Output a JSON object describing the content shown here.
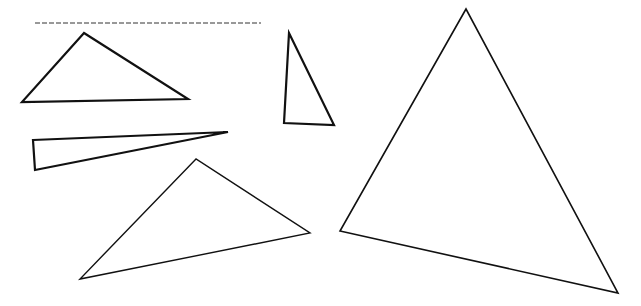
{
  "canvas": {
    "width": 641,
    "height": 306,
    "background": "#ffffff",
    "stroke": "#111111"
  },
  "name_line": {
    "x1": 35,
    "y1": 23,
    "x2": 261,
    "y2": 23,
    "dashed": true
  },
  "triangles": [
    {
      "id": "triangle-1",
      "points": "84,33 22,102 188,99",
      "stroke_width": 2.2
    },
    {
      "id": "triangle-2",
      "points": "289,33 284,123 334,125",
      "stroke_width": 2.2
    },
    {
      "id": "triangle-3",
      "points": "33,140 228,132 35,170",
      "stroke_width": 2.2
    },
    {
      "id": "triangle-4",
      "points": "196,159 80,279 310,233",
      "stroke_width": 1.4
    },
    {
      "id": "triangle-5",
      "points": "466,9 340,231 618,293",
      "stroke_width": 1.6
    }
  ]
}
